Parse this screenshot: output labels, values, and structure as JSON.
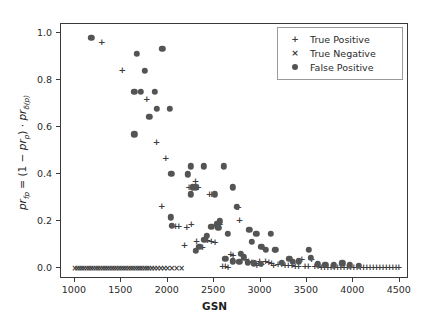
{
  "chart_data": {
    "type": "scatter",
    "title": "",
    "xlabel": "GSN",
    "ylabel": "pr_fp = (1 - pr_p) . pr_d(p)",
    "ylabel_parts": {
      "lhs": "pr",
      "lhs_sub": "fp",
      "eq": " = (1 − ",
      "term1": "pr",
      "term1_sub": "p",
      "mid": ") · ",
      "term2": "pr",
      "term2_sub": "δ(p)"
    },
    "xlim": [
      850,
      4600
    ],
    "ylim": [
      -0.045,
      1.04
    ],
    "xticks": [
      1000,
      1500,
      2000,
      2500,
      3000,
      3500,
      4000,
      4500
    ],
    "xticklabels": [
      "1000",
      "1500",
      "2000",
      "2500",
      "3000",
      "3500",
      "4000",
      "4500"
    ],
    "yticks": [
      0.0,
      0.2,
      0.4,
      0.6,
      0.8,
      1.0
    ],
    "yticklabels": [
      "0.0",
      "0.2",
      "0.4",
      "0.6",
      "0.8",
      "1.0"
    ],
    "grid": false,
    "legend_position": "upper right",
    "marker_color": "#545454",
    "series": [
      {
        "name": "True Positive",
        "marker": "plus",
        "glyph": "+",
        "color": "#3c3c3c",
        "points": [
          [
            1290,
            0.965
          ],
          [
            1510,
            0.845
          ],
          [
            1775,
            0.72
          ],
          [
            1880,
            0.538
          ],
          [
            1980,
            0.468
          ],
          [
            1935,
            0.265
          ],
          [
            2085,
            0.182
          ],
          [
            2120,
            0.182
          ],
          [
            2230,
            0.345
          ],
          [
            2255,
            0.345
          ],
          [
            2300,
            0.372
          ],
          [
            2255,
            0.188
          ],
          [
            2330,
            0.345
          ],
          [
            2450,
            0.315
          ],
          [
            2475,
            0.315
          ],
          [
            2205,
            0.178
          ],
          [
            2180,
            0.098
          ],
          [
            2310,
            0.118
          ],
          [
            2375,
            0.092
          ],
          [
            2430,
            0.122
          ],
          [
            2470,
            0.118
          ],
          [
            2510,
            0.112
          ],
          [
            2545,
            0.178
          ],
          [
            2560,
            0.188
          ],
          [
            2680,
            0.06
          ],
          [
            2705,
            0.056
          ],
          [
            2745,
            0.262
          ],
          [
            2760,
            0.262
          ],
          [
            2775,
            0.205
          ],
          [
            2835,
            0.038
          ],
          [
            2870,
            0.03
          ],
          [
            2905,
            0.028
          ],
          [
            2950,
            0.025
          ],
          [
            2990,
            0.03
          ],
          [
            3025,
            0.09
          ],
          [
            3055,
            0.032
          ],
          [
            3090,
            0.028
          ],
          [
            3120,
            0.022
          ],
          [
            3155,
            0.078
          ],
          [
            3190,
            0.02
          ],
          [
            3230,
            0.018
          ],
          [
            3265,
            0.016
          ],
          [
            3300,
            0.014
          ],
          [
            3340,
            0.014
          ],
          [
            3375,
            0.012
          ],
          [
            3410,
            0.012
          ],
          [
            3445,
            0.04
          ],
          [
            3480,
            0.012
          ],
          [
            3515,
            0.01
          ],
          [
            3550,
            0.042
          ],
          [
            3585,
            0.01
          ],
          [
            3620,
            0.01
          ],
          [
            3655,
            0.008
          ],
          [
            3690,
            0.008
          ],
          [
            3725,
            0.008
          ],
          [
            3760,
            0.008
          ],
          [
            3795,
            0.008
          ],
          [
            3830,
            0.008
          ],
          [
            3865,
            0.006
          ],
          [
            3900,
            0.006
          ],
          [
            3935,
            0.006
          ],
          [
            3970,
            0.006
          ],
          [
            4005,
            0.006
          ],
          [
            4040,
            0.006
          ],
          [
            4075,
            0.006
          ],
          [
            4110,
            0.006
          ],
          [
            4145,
            0.006
          ],
          [
            4180,
            0.006
          ],
          [
            4215,
            0.006
          ],
          [
            4250,
            0.005
          ],
          [
            4285,
            0.005
          ],
          [
            4320,
            0.005
          ],
          [
            4355,
            0.005
          ],
          [
            4390,
            0.005
          ],
          [
            4425,
            0.005
          ],
          [
            4460,
            0.005
          ],
          [
            4490,
            0.005
          ],
          [
            2960,
            0.015
          ],
          [
            3010,
            0.018
          ],
          [
            3140,
            0.015
          ],
          [
            2620,
            0.01
          ],
          [
            2650,
            0.008
          ],
          [
            2590,
            0.012
          ]
        ]
      },
      {
        "name": "True Negative",
        "marker": "cross",
        "glyph": "×",
        "color": "#3c3c3c",
        "points": [
          [
            1000,
            0.0
          ],
          [
            1025,
            0.0
          ],
          [
            1050,
            0.0
          ],
          [
            1075,
            0.0
          ],
          [
            1100,
            0.0
          ],
          [
            1125,
            0.0
          ],
          [
            1150,
            0.0
          ],
          [
            1175,
            0.0
          ],
          [
            1200,
            0.0
          ],
          [
            1225,
            0.0
          ],
          [
            1250,
            0.0
          ],
          [
            1275,
            0.0
          ],
          [
            1300,
            0.0
          ],
          [
            1325,
            0.0
          ],
          [
            1350,
            0.0
          ],
          [
            1375,
            0.0
          ],
          [
            1400,
            0.0
          ],
          [
            1425,
            0.0
          ],
          [
            1450,
            0.0
          ],
          [
            1475,
            0.0
          ],
          [
            1500,
            0.0
          ],
          [
            1525,
            0.0
          ],
          [
            1550,
            0.0
          ],
          [
            1575,
            0.0
          ],
          [
            1600,
            0.0
          ],
          [
            1625,
            0.0
          ],
          [
            1650,
            0.0
          ],
          [
            1675,
            0.0
          ],
          [
            1700,
            0.0
          ],
          [
            1725,
            0.0
          ],
          [
            1750,
            0.0
          ],
          [
            1775,
            0.0
          ],
          [
            1800,
            0.0
          ],
          [
            1830,
            0.0
          ],
          [
            1860,
            0.0
          ],
          [
            1890,
            0.0
          ],
          [
            1925,
            0.0
          ],
          [
            1960,
            0.0
          ],
          [
            2000,
            0.0
          ],
          [
            2045,
            0.0
          ],
          [
            2095,
            0.0
          ],
          [
            2150,
            0.0
          ]
        ]
      },
      {
        "name": "False Positive",
        "marker": "circle",
        "glyph": "●",
        "color": "#545454",
        "points": [
          [
            1175,
            0.982
          ],
          [
            1940,
            0.935
          ],
          [
            1665,
            0.912
          ],
          [
            1755,
            0.842
          ],
          [
            1640,
            0.752
          ],
          [
            1710,
            0.752
          ],
          [
            1860,
            0.752
          ],
          [
            1880,
            0.68
          ],
          [
            2025,
            0.68
          ],
          [
            1800,
            0.645
          ],
          [
            1640,
            0.57
          ],
          [
            2250,
            0.435
          ],
          [
            2390,
            0.435
          ],
          [
            2605,
            0.435
          ],
          [
            2040,
            0.402
          ],
          [
            2215,
            0.4
          ],
          [
            2270,
            0.345
          ],
          [
            2305,
            0.345
          ],
          [
            2700,
            0.345
          ],
          [
            2250,
            0.315
          ],
          [
            2510,
            0.315
          ],
          [
            2745,
            0.262
          ],
          [
            2035,
            0.218
          ],
          [
            2045,
            0.182
          ],
          [
            2560,
            0.2
          ],
          [
            2530,
            0.188
          ],
          [
            2420,
            0.138
          ],
          [
            2395,
            0.122
          ],
          [
            2650,
            0.148
          ],
          [
            2880,
            0.165
          ],
          [
            2905,
            0.112
          ],
          [
            2955,
            0.148
          ],
          [
            3010,
            0.092
          ],
          [
            3055,
            0.08
          ],
          [
            3110,
            0.148
          ],
          [
            3160,
            0.08
          ],
          [
            2790,
            0.062
          ],
          [
            2820,
            0.048
          ],
          [
            3310,
            0.042
          ],
          [
            3410,
            0.03
          ],
          [
            3520,
            0.078
          ],
          [
            3545,
            0.045
          ],
          [
            3880,
            0.022
          ],
          [
            2470,
            0.178
          ],
          [
            2545,
            0.172
          ],
          [
            2340,
            0.092
          ],
          [
            2300,
            0.075
          ],
          [
            2620,
            0.04
          ],
          [
            2700,
            0.03
          ],
          [
            2770,
            0.028
          ],
          [
            3230,
            0.025
          ],
          [
            3350,
            0.028
          ],
          [
            3620,
            0.018
          ],
          [
            3700,
            0.015
          ],
          [
            3790,
            0.014
          ],
          [
            3960,
            0.014
          ],
          [
            4060,
            0.012
          ],
          [
            2860,
            0.025
          ],
          [
            2930,
            0.022
          ],
          [
            3000,
            0.02
          ]
        ]
      }
    ]
  },
  "legend": {
    "items": [
      {
        "label": "True Positive",
        "symbol": "+"
      },
      {
        "label": "True Negative",
        "symbol": "×"
      },
      {
        "label": "False Positive",
        "symbol": "dot"
      }
    ]
  }
}
